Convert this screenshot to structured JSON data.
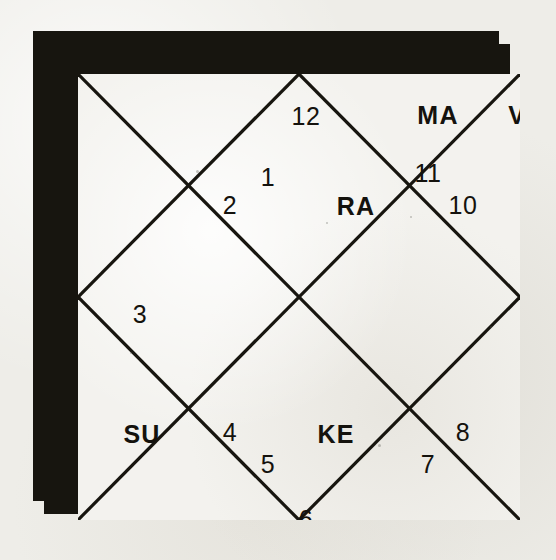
{
  "chart": {
    "style": "north-indian-rashi-kundali",
    "frame_color": "#17150f",
    "field_color": "#f3f2ee",
    "ink_color": "#14120d",
    "houses": [
      {
        "number": "1",
        "cx": 190,
        "cy": 103
      },
      {
        "number": "2",
        "cx": 152,
        "cy": 131
      },
      {
        "number": "3",
        "cx": 62,
        "cy": 240
      },
      {
        "number": "4",
        "cx": 152,
        "cy": 358
      },
      {
        "number": "5",
        "cx": 190,
        "cy": 390
      },
      {
        "number": "6",
        "cx": 228,
        "cy": 445
      },
      {
        "number": "7",
        "cx": 350,
        "cy": 390
      },
      {
        "number": "8",
        "cx": 385,
        "cy": 358
      },
      {
        "number": "9",
        "cx": 478,
        "cy": 240
      },
      {
        "number": "10",
        "cx": 385,
        "cy": 131
      },
      {
        "number": "11",
        "cx": 350,
        "cy": 99
      },
      {
        "number": "12",
        "cx": 228,
        "cy": 42
      }
    ],
    "planets": [
      {
        "code": "RA",
        "name": "Rahu",
        "cx": 278,
        "cy": 132
      },
      {
        "code": "MA",
        "name": "Mars",
        "cx": 360,
        "cy": 41
      },
      {
        "code": "VE",
        "name": "Venus",
        "cx": 448,
        "cy": 41
      },
      {
        "code": "MO",
        "name": "Moon",
        "cx": 473,
        "cy": 132
      },
      {
        "code": "JU",
        "name": "Jupiter",
        "cx": 473,
        "cy": 360
      },
      {
        "code": "SA",
        "name": "Saturn",
        "cx": 449,
        "cy": 457
      },
      {
        "code": "ME",
        "name": "Mercury",
        "cx": 360,
        "cy": 457
      },
      {
        "code": "KE",
        "name": "Ketu",
        "cx": 258,
        "cy": 360
      },
      {
        "code": "SU",
        "name": "Sun",
        "cx": 64,
        "cy": 360
      }
    ]
  }
}
